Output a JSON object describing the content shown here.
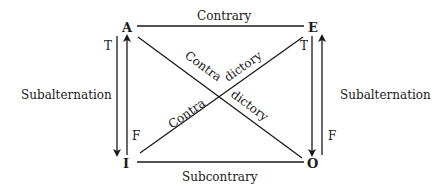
{
  "diagram": {
    "corners": {
      "top_left": "A",
      "top_right": "E",
      "bottom_left": "I",
      "bottom_right": "O"
    },
    "relations": {
      "top": "Contrary",
      "bottom": "Subcontrary",
      "left": "Subalternation",
      "right": "Subalternation",
      "diagonal_a_o_part1": "Contra",
      "diagonal_a_o_part2": "dictory",
      "diagonal_i_e_part1": "Contra",
      "diagonal_i_e_part2": "dictory"
    },
    "truth_labels": {
      "left_down": "T",
      "left_up": "F",
      "right_down": "T",
      "right_up": "F"
    },
    "colors": {
      "ink": "#1a1a1a",
      "background": "#ffffff"
    }
  }
}
